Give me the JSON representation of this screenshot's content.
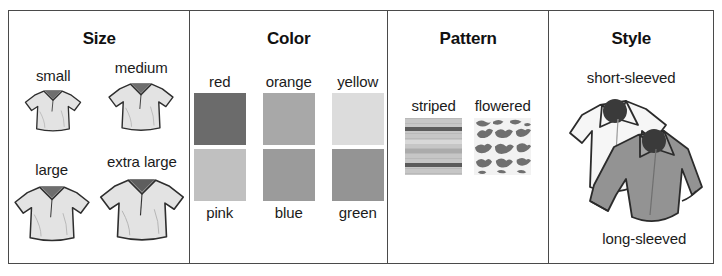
{
  "figure": {
    "border_color": "#4a4a4a",
    "background": "#ffffff"
  },
  "panels": [
    {
      "id": "size",
      "title": "Size",
      "items": [
        {
          "label": "small",
          "icon": "polo-shirt-icon",
          "scale": 0.72
        },
        {
          "label": "medium",
          "icon": "polo-shirt-icon",
          "scale": 0.86
        },
        {
          "label": "large",
          "icon": "polo-shirt-icon",
          "scale": 1.0
        },
        {
          "label": "extra large",
          "icon": "polo-shirt-icon",
          "scale": 1.14
        }
      ]
    },
    {
      "id": "color",
      "title": "Color",
      "items": [
        {
          "label": "red",
          "swatch": "#6b6b6b"
        },
        {
          "label": "orange",
          "swatch": "#a8a8a8"
        },
        {
          "label": "yellow",
          "swatch": "#dcdcdc"
        },
        {
          "label": "pink",
          "swatch": "#c0c0c0"
        },
        {
          "label": "blue",
          "swatch": "#9b9b9b"
        },
        {
          "label": "green",
          "swatch": "#949494"
        }
      ]
    },
    {
      "id": "pattern",
      "title": "Pattern",
      "items": [
        {
          "label": "striped",
          "swatch": "striped-pattern-icon"
        },
        {
          "label": "flowered",
          "swatch": "flowered-pattern-icon"
        }
      ]
    },
    {
      "id": "style",
      "title": "Style",
      "items": [
        {
          "label": "short-sleeved",
          "icon": "short-sleeved-shirt-icon",
          "fill": "#f4f4f4"
        },
        {
          "label": "long-sleeved",
          "icon": "long-sleeved-shirt-icon",
          "fill": "#8e8e8e"
        }
      ]
    }
  ]
}
